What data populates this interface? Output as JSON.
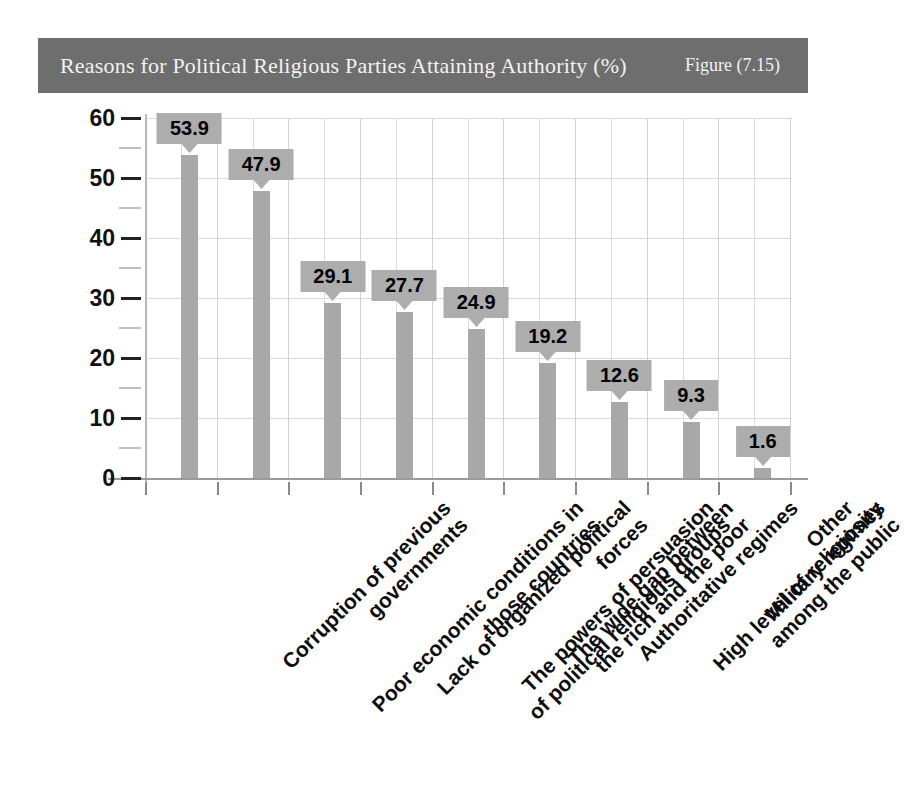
{
  "header": {
    "title": "Reasons for Political Religious Parties Attaining Authority (%)",
    "figure_label": "Figure (7.15)",
    "bar_color": "#6e6e6e",
    "text_color": "#f2f2f2"
  },
  "chart_data": {
    "type": "bar",
    "title": "Reasons for Political Religious Parties Attaining Authority (%)",
    "xlabel": "",
    "ylabel": "",
    "ylim": [
      0,
      60
    ],
    "yticks": [
      0,
      10,
      20,
      30,
      40,
      50,
      60
    ],
    "yminor_ticks": [
      5,
      15,
      25,
      35,
      45,
      55
    ],
    "grid": true,
    "legend": null,
    "units": "%",
    "series_color": "#a8a8a8",
    "label_box_color": "#adadad",
    "categories": [
      "Corruption of previous governments",
      "Poor economic conditions in those countries",
      "Lack of organized political forces",
      "The powers of persuasion of political religious groups",
      "The wide gap between the rich and the poor",
      "Authoritative regimes",
      "High level of religiosity among the public",
      "Military regimes",
      "Other"
    ],
    "category_lines": [
      [
        "Corruption of previous",
        "governments"
      ],
      [
        "Poor economic conditions in",
        "those countries"
      ],
      [
        "Lack of organized political",
        "forces"
      ],
      [
        "The powers of persuasion",
        "of political religious groups"
      ],
      [
        "The wide gap between",
        "the rich and the poor"
      ],
      [
        "Authoritative regimes"
      ],
      [
        "High level of religiosity",
        "among the public"
      ],
      [
        "Military regimes"
      ],
      [
        "Other"
      ]
    ],
    "values": [
      53.9,
      47.9,
      29.1,
      27.7,
      24.9,
      19.2,
      12.6,
      9.3,
      1.6
    ],
    "value_labels": [
      "53.9",
      "47.9",
      "29.1",
      "27.7",
      "24.9",
      "19.2",
      "12.6",
      "9.3",
      "1.6"
    ]
  }
}
